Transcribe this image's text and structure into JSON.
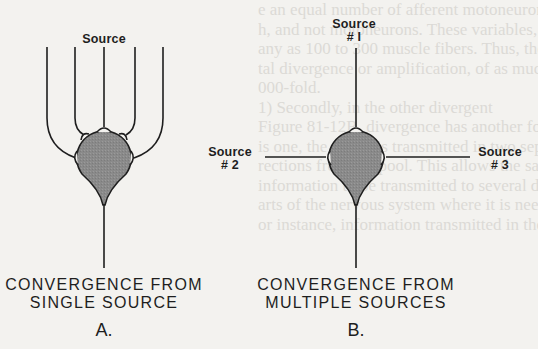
{
  "figure": {
    "panels": [
      {
        "id": "A",
        "letter": "A.",
        "caption_line1": "CONVERGENCE  FROM",
        "caption_line2": "SINGLE  SOURCE",
        "source_label": "Source",
        "input_fibers": 5
      },
      {
        "id": "B",
        "letter": "B.",
        "caption_line1": "CONVERGENCE  FROM",
        "caption_line2": "MULTIPLE  SOURCES",
        "sources": [
          {
            "name": "Source",
            "number": "# I"
          },
          {
            "name": "Source",
            "number": "# 2"
          },
          {
            "name": "Source",
            "number": "# 3"
          }
        ]
      }
    ],
    "colors": {
      "soma_fill": "#8c8c8c",
      "line": "#1e1e1e",
      "paper": "#f3f2ef"
    }
  },
  "bleed_through_text": [
    "e an equal number of afferent motoneuron",
    "h, and not motoneurons. These variables, a",
    "any as 100 to 300 muscle fibers. Thus, there is",
    "tal divergence or amplification, of as much as",
    "000-fold.",
    "1) Secondly, in the other divergent",
    "Figure 81-12B, divergence has another form. In",
    "is one, the signal is transmitted in two separate",
    "rections from the pool. This allows the same",
    "information to be transmitted to several different",
    "arts of the nervous system where it is needed.",
    "or instance, information transmitted in the dorsal",
    "",
    "",
    "",
    "",
    "",
    ""
  ]
}
